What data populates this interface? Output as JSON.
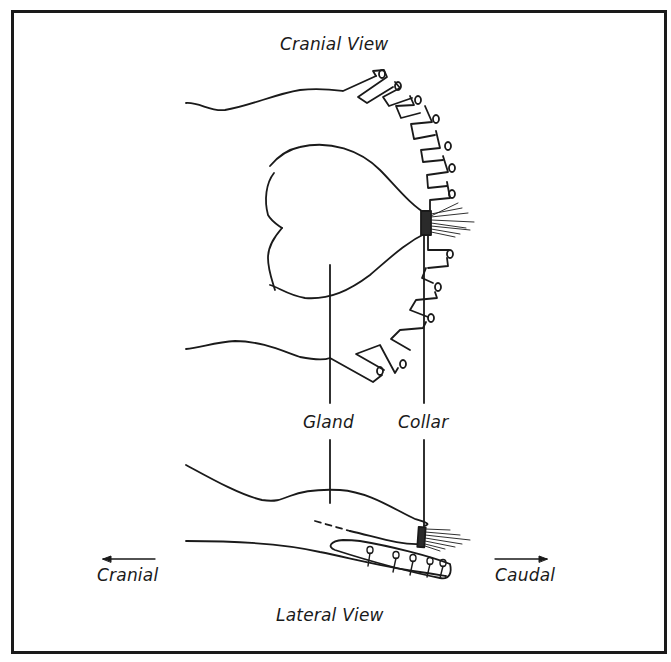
{
  "diagram": {
    "border_color": "#1a1a1a",
    "line_color": "#1a1a1a",
    "labels": {
      "cranial_view": "Cranial View",
      "lateral_view": "Lateral View",
      "gland": "Gland",
      "collar": "Collar",
      "direction_left": "Cranial",
      "direction_right": "Caudal"
    },
    "arrows": {
      "left": "left-arrow",
      "right": "right-arrow"
    }
  }
}
